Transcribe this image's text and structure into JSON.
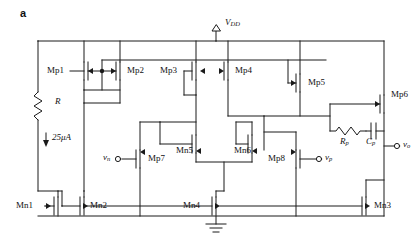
{
  "figure": {
    "panel_label": "a",
    "kind": "circuit-schematic"
  },
  "rails": {
    "supply_label": "V",
    "supply_sub": "DD",
    "ground_label": "ground-symbol"
  },
  "passives": {
    "bias_resistor": "R",
    "bias_current": "25μA",
    "comp_resistor": "R",
    "comp_resistor_sub": "p",
    "comp_capacitor": "C",
    "comp_capacitor_sub": "p"
  },
  "ports": {
    "in_neg": "v",
    "in_neg_sub": "n",
    "in_pos": "v",
    "in_pos_sub": "p",
    "out": "v",
    "out_sub": "o"
  },
  "transistors": [
    {
      "id": "Mp1",
      "type": "pmos"
    },
    {
      "id": "Mp2",
      "type": "pmos"
    },
    {
      "id": "Mp3",
      "type": "pmos"
    },
    {
      "id": "Mp4",
      "type": "pmos"
    },
    {
      "id": "Mp5",
      "type": "pmos"
    },
    {
      "id": "Mp6",
      "type": "pmos"
    },
    {
      "id": "Mp7",
      "type": "pmos"
    },
    {
      "id": "Mp8",
      "type": "pmos"
    },
    {
      "id": "Mn1",
      "type": "nmos"
    },
    {
      "id": "Mn2",
      "type": "nmos"
    },
    {
      "id": "Mn3",
      "type": "nmos"
    },
    {
      "id": "Mn4",
      "type": "nmos"
    },
    {
      "id": "Mn5",
      "type": "nmos"
    },
    {
      "id": "Mn6",
      "type": "nmos"
    }
  ],
  "colors": {
    "wire": "#1a1a1a",
    "text": "#111111",
    "background": "#ffffff"
  }
}
